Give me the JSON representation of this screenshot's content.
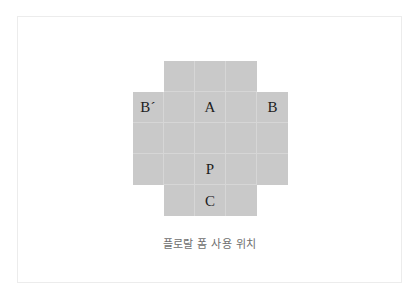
{
  "card": {
    "background_color": "#ffffff",
    "border_color": "#ececec"
  },
  "diagram": {
    "name": "floral-foam-placement-grid",
    "shape": "plus-cross",
    "columns": 5,
    "rows": 5,
    "cell_fill_color": "#c9c9c9",
    "cell_gridline_color": "#d6d6d6",
    "label_color": "#1d1d1d",
    "cells": [
      [
        {
          "filled": false,
          "label": ""
        },
        {
          "filled": true,
          "label": ""
        },
        {
          "filled": true,
          "label": ""
        },
        {
          "filled": true,
          "label": ""
        },
        {
          "filled": false,
          "label": ""
        }
      ],
      [
        {
          "filled": true,
          "label": "B´"
        },
        {
          "filled": true,
          "label": ""
        },
        {
          "filled": true,
          "label": "A"
        },
        {
          "filled": true,
          "label": ""
        },
        {
          "filled": true,
          "label": "B"
        }
      ],
      [
        {
          "filled": true,
          "label": ""
        },
        {
          "filled": true,
          "label": ""
        },
        {
          "filled": true,
          "label": ""
        },
        {
          "filled": true,
          "label": ""
        },
        {
          "filled": true,
          "label": ""
        }
      ],
      [
        {
          "filled": true,
          "label": ""
        },
        {
          "filled": true,
          "label": ""
        },
        {
          "filled": true,
          "label": "P"
        },
        {
          "filled": true,
          "label": ""
        },
        {
          "filled": true,
          "label": ""
        }
      ],
      [
        {
          "filled": false,
          "label": ""
        },
        {
          "filled": true,
          "label": ""
        },
        {
          "filled": true,
          "label": "C"
        },
        {
          "filled": true,
          "label": ""
        },
        {
          "filled": false,
          "label": ""
        }
      ]
    ]
  },
  "caption": {
    "text": "플로랄 폼 사용 위치",
    "color": "#6e6e6e"
  }
}
